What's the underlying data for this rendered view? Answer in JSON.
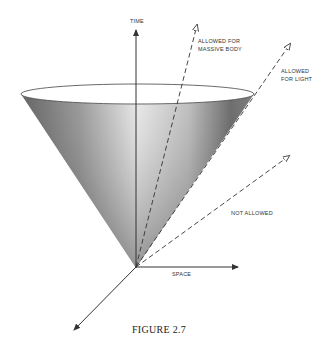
{
  "figure": {
    "caption": "FIGURE 2.7",
    "axes": {
      "time_label": "TIME",
      "space_label": "SPACE"
    },
    "trajectories": [
      {
        "label_line1": "ALLOWED FOR",
        "label_line2": "MASSIVE BODY",
        "style": "dashed"
      },
      {
        "label_line1": "ALLOWED",
        "label_line2": "FOR LIGHT",
        "style": "dashed"
      },
      {
        "label_line1": "NOT ALLOWED",
        "label_line2": "",
        "style": "dashed"
      }
    ],
    "colors": {
      "cone_dark": "#3a3a3a",
      "cone_light": "#e8e8e8",
      "line": "#333333",
      "background": "#ffffff"
    }
  }
}
